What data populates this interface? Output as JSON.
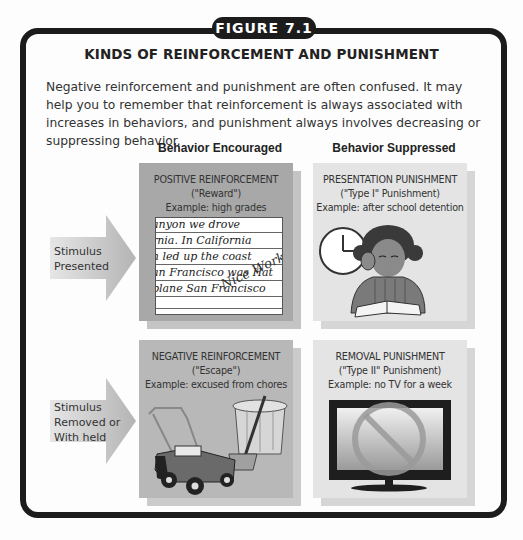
{
  "figure": {
    "tab_label": "FIGURE 7.1",
    "title": "KINDS OF REINFORCEMENT AND PUNISHMENT",
    "intro_text": "Negative reinforcement and punishment are often confused. It may help you to remember that reinforcement is always associated with increases in behaviors, and punishment always involves decreasing or suppressing behavior."
  },
  "columns": [
    {
      "label": "Behavior Encouraged"
    },
    {
      "label": "Behavior Suppressed"
    }
  ],
  "rows": [
    {
      "label_line1": "Stimulus",
      "label_line2": "Presented",
      "label_line3": ""
    },
    {
      "label_line1": "Stimulus",
      "label_line2": "Removed or",
      "label_line3": "With held"
    }
  ],
  "cells": {
    "positive_reinforcement": {
      "name": "POSITIVE REINFORCEMENT",
      "alias": "(\"Reward\")",
      "example": "Example: high grades",
      "image": "handwritten-paper-image",
      "paper_lines": [
        "anyon we drove",
        "rnia. In California",
        "h led up the coast",
        "an Francisco was Hat",
        "plane San Francisco"
      ],
      "paper_note": "Nice Work!"
    },
    "presentation_punishment": {
      "name": "PRESENTATION PUNISHMENT",
      "alias": "(\"Type I\" Punishment)",
      "example": "Example: after school detention",
      "image": "girl-reading-with-clock-image"
    },
    "negative_reinforcement": {
      "name": "NEGATIVE REINFORCEMENT",
      "alias": "(\"Escape\")",
      "example": "Example: excused from chores",
      "image": "lawnmower-and-trashcan-image"
    },
    "removal_punishment": {
      "name": "REMOVAL PUNISHMENT",
      "alias": "(\"Type II\" Punishment)",
      "example": "Example: no TV for a week",
      "image": "tv-with-no-symbol-image"
    }
  },
  "colors": {
    "frame": "#1c1c1c",
    "reinforcement_box": "#a8a8a8",
    "punishment_box": "#e4e4e4",
    "arrow": "#bdbdbd"
  }
}
